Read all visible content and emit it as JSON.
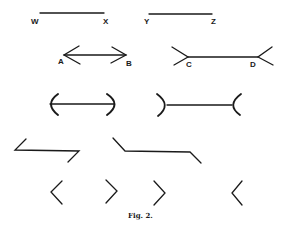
{
  "figure": {
    "caption": "Fig. 2.",
    "labels": {
      "w": "W",
      "x": "X",
      "y": "Y",
      "z": "Z",
      "a": "A",
      "b": "B",
      "c": "C",
      "d": "D"
    },
    "rows": [
      {
        "name": "plain-lines",
        "items": [
          "line-wx",
          "line-yz"
        ]
      },
      {
        "name": "arrow-lines",
        "items": [
          "arrow-ab-inward-heads",
          "arrow-cd-outward-tails"
        ]
      },
      {
        "name": "arc-lines",
        "items": [
          "line-with-outward-arcs",
          "line-with-inward-arcs"
        ]
      },
      {
        "name": "zigzag-lines",
        "items": [
          "z-shape-left",
          "bent-line-right"
        ]
      },
      {
        "name": "chevrons",
        "items": [
          "chevron-left",
          "chevron-right",
          "chevron-right",
          "chevron-left"
        ]
      }
    ]
  }
}
